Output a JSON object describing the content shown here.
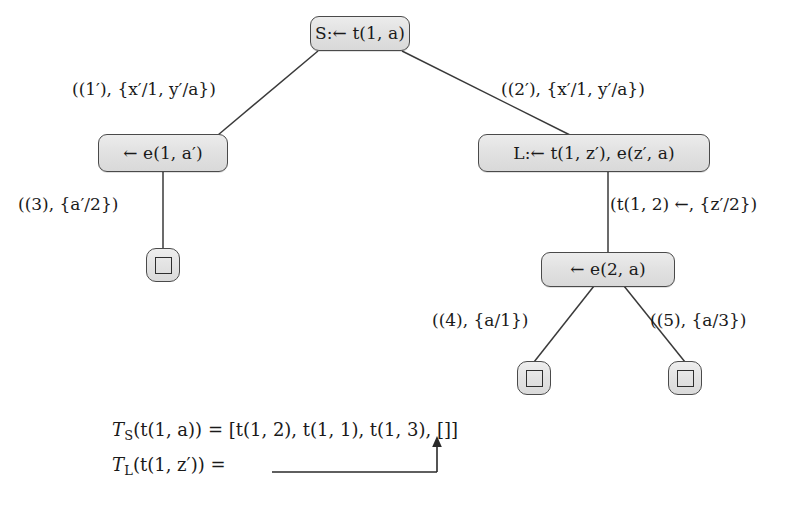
{
  "figure": {
    "type": "sld-derivation-tree",
    "background_color": "#ffffff",
    "node_fill_color": "#e4e4e4",
    "node_border_color": "#4a4a4a",
    "text_color": "#1a1a1a"
  },
  "tree": {
    "nodes": [
      {
        "id": "root",
        "label": "S:← t(1, a)",
        "kind": "goal"
      },
      {
        "id": "n_left",
        "label": "← e(1, a′)",
        "kind": "goal"
      },
      {
        "id": "n_right",
        "label": "L:← t(1, z′), e(z′, a)",
        "kind": "goal"
      },
      {
        "id": "n_e2a",
        "label": "← e(2, a)",
        "kind": "goal"
      },
      {
        "id": "leaf1",
        "label": "□",
        "kind": "empty-clause"
      },
      {
        "id": "leaf4",
        "label": "□",
        "kind": "empty-clause"
      },
      {
        "id": "leaf5",
        "label": "□",
        "kind": "empty-clause"
      }
    ],
    "edges": [
      {
        "from": "root",
        "to": "n_left",
        "label": "((1′), {x′/1, y′/a})"
      },
      {
        "from": "root",
        "to": "n_right",
        "label": "((2′), {x′/1, y′/a})"
      },
      {
        "from": "n_left",
        "to": "leaf1",
        "label": "((3), {a′/2})"
      },
      {
        "from": "n_right",
        "to": "n_e2a",
        "label": "(t(1, 2) ←, {z′/2})"
      },
      {
        "from": "n_e2a",
        "to": "leaf4",
        "label": "((4), {a/1})"
      },
      {
        "from": "n_e2a",
        "to": "leaf5",
        "label": "((5), {a/3})"
      }
    ]
  },
  "formulas": {
    "line1": {
      "lhs": "T",
      "lhs_sub": "S",
      "lhs_arg": "(t(1, a))",
      "eq": "=",
      "rhs": "[t(1, 2), t(1, 1), t(1, 3), []]",
      "full": "T_S(t(1, a)) = [t(1, 2), t(1, 1), t(1, 3), []]"
    },
    "line2": {
      "lhs": "T",
      "lhs_sub": "L",
      "lhs_arg": "(t(1, z′))",
      "eq": "=",
      "rhs": "",
      "annotation": "arrow-pointing-to-empty-list",
      "full": "T_L(t(1, z′)) ="
    }
  },
  "caption": {
    "text": ""
  }
}
